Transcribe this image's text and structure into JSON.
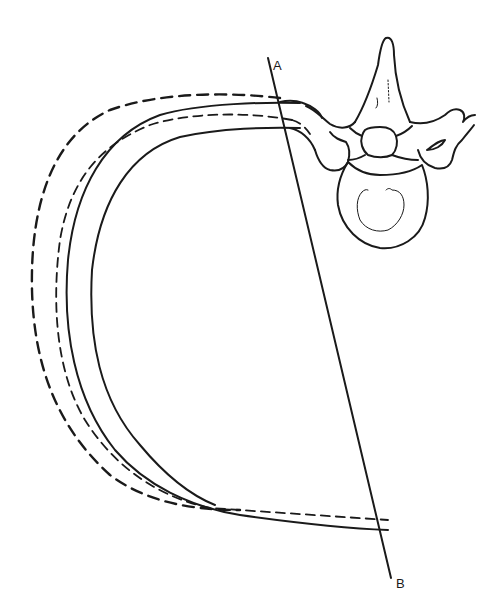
{
  "figure": {
    "type": "anatomical line drawing",
    "labels": {
      "line_top": "A",
      "line_bottom": "B"
    },
    "line_AB": {
      "from": [
        268,
        58
      ],
      "to": [
        391,
        578
      ]
    },
    "curves": [
      {
        "name": "outer-dashed-rib",
        "style": "dashed"
      },
      {
        "name": "inner-dashed-rib",
        "style": "dashed"
      },
      {
        "name": "outer-solid-rib",
        "style": "solid"
      },
      {
        "name": "inner-solid-rib",
        "style": "solid"
      }
    ],
    "colors": {
      "ink": "#1a1a1a",
      "background": "#ffffff"
    }
  }
}
